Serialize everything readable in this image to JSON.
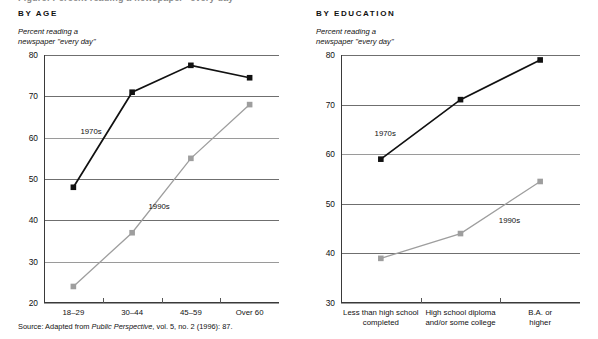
{
  "figure": {
    "main_title": "Figure: Percent reading a newspaper \"every day\"",
    "source_prefix": "Source: Adapted from ",
    "source_italic": "Public Perspective",
    "source_suffix": ", vol. 5, no. 2 (1996): 87."
  },
  "panels": [
    {
      "title": "BY AGE",
      "caption": "Percent reading a\nnewspaper \"every day\""
    },
    {
      "title": "BY EDUCATION",
      "caption": "Percent reading a\nnewspaper \"every day\""
    }
  ],
  "chart_data": [
    {
      "type": "line",
      "title": "BY AGE",
      "xlabel": "",
      "ylabel": "Percent reading a newspaper \"every day\"",
      "categories": [
        "18–29",
        "30–44",
        "45–59",
        "Over 60"
      ],
      "ylim": [
        20,
        80
      ],
      "yticks": [
        20,
        30,
        40,
        50,
        60,
        70,
        80
      ],
      "grid": true,
      "legend": "inline-annotations",
      "series": [
        {
          "name": "1970s",
          "color": "#111111",
          "marker": "square",
          "values": [
            48,
            71,
            77.5,
            74.5
          ]
        },
        {
          "name": "1990s",
          "color": "#9e9e9e",
          "marker": "square",
          "values": [
            24,
            37,
            55,
            68
          ]
        }
      ],
      "annotations": [
        {
          "text": "1970s",
          "x_frac": 0.2,
          "value": 61.5
        },
        {
          "text": "1990s",
          "x_frac": 0.49,
          "value": 43.5
        }
      ]
    },
    {
      "type": "line",
      "title": "BY EDUCATION",
      "xlabel": "",
      "ylabel": "Percent reading a newspaper \"every day\"",
      "categories": [
        "Less than high school\ncompleted",
        "High school diploma\nand/or some college",
        "B.A. or higher"
      ],
      "ylim": [
        30,
        80
      ],
      "yticks": [
        30,
        40,
        50,
        60,
        70,
        80
      ],
      "grid": true,
      "legend": "inline-annotations",
      "series": [
        {
          "name": "1970s",
          "color": "#111111",
          "marker": "square",
          "values": [
            59,
            71,
            79
          ]
        },
        {
          "name": "1990s",
          "color": "#9e9e9e",
          "marker": "square",
          "values": [
            39,
            44,
            54.5
          ]
        }
      ],
      "annotations": [
        {
          "text": "1970s",
          "x_frac": 0.185,
          "value": 64.2
        },
        {
          "text": "1990s",
          "x_frac": 0.705,
          "value": 46.8
        }
      ]
    }
  ]
}
